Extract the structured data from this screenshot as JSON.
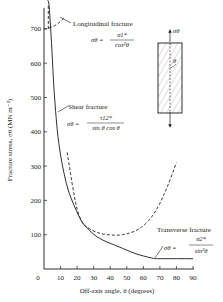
{
  "chart_data": {
    "type": "line",
    "title": "",
    "xlabel": "Off-axis angle, θ (degrees)",
    "ylabel": "Fracture stress, σθ (MN m⁻²)",
    "xlim": [
      0,
      90
    ],
    "ylim": [
      0,
      750
    ],
    "x_ticks": [
      0,
      10,
      20,
      30,
      40,
      50,
      60,
      70,
      80,
      90
    ],
    "y_ticks": [
      100,
      200,
      300,
      400,
      500,
      600,
      700
    ],
    "grid": false,
    "legend": null,
    "series": [
      {
        "name": "Longitudinal fracture",
        "style": "dashed",
        "formula": "σθ = σ1* / cos²θ",
        "x": [
          0,
          2,
          4,
          6,
          8,
          10,
          12
        ],
        "y": [
          700,
          701,
          704,
          708,
          714,
          722,
          732
        ]
      },
      {
        "name": "Shear fracture",
        "style": "solid",
        "formula": "σθ = τ12* / (sin θ cos θ)",
        "x": [
          2,
          3,
          4,
          5,
          6,
          8,
          10,
          12,
          15,
          20,
          23,
          25,
          30,
          35,
          40,
          45,
          50,
          55,
          60,
          65,
          67
        ],
        "y": [
          900,
          780,
          700,
          620,
          520,
          400,
          330,
          280,
          220,
          165,
          135,
          125,
          100,
          85,
          75,
          65,
          55,
          45,
          38,
          32,
          30
        ]
      },
      {
        "name": "Transverse fracture",
        "style": "dashed",
        "formula": "σθ = σ2* / sin²θ",
        "x": [
          14,
          16,
          18,
          20,
          23,
          25,
          30,
          35,
          40,
          45,
          50,
          55,
          60,
          65,
          70,
          75,
          80
        ],
        "y": [
          340,
          280,
          220,
          170,
          135,
          125,
          110,
          102,
          99,
          98,
          102,
          110,
          125,
          150,
          190,
          245,
          310
        ]
      },
      {
        "name": "Transverse fracture (lower bound)",
        "style": "solid",
        "x": [
          67,
          70,
          80,
          90
        ],
        "y": [
          30,
          30,
          30,
          30
        ]
      }
    ],
    "annotations": [
      {
        "text": "Longitudinal fracture",
        "formula_lhs": "σθ =",
        "formula_num": "σ1*",
        "formula_den": "cos²θ"
      },
      {
        "text": "Shear fracture",
        "formula_lhs": "σθ =",
        "formula_num": "τ12*",
        "formula_den": "sin θ cos θ"
      },
      {
        "text": "Transverse fracture",
        "formula_lhs": "σθ =",
        "formula_num": "σ2*",
        "formula_den": "sin²θ"
      }
    ],
    "inset": {
      "description": "Specimen with fibres at angle θ under uniaxial stress",
      "stress_label": "σθ",
      "angle_label": "θ"
    }
  },
  "labels": {
    "x_axis_title": "Off-axis angle, θ (degrees)",
    "y_axis_title": "Fracture stress, σθ (MN m⁻²)",
    "x_ticks": [
      "0",
      "10",
      "20",
      "30",
      "40",
      "50",
      "60",
      "70",
      "80",
      "90"
    ],
    "y_ticks": [
      "100",
      "200",
      "300",
      "400",
      "500",
      "600",
      "700"
    ],
    "longitudinal": {
      "name": "Longitudinal fracture",
      "lhs": "σθ =",
      "num": "σ1*",
      "den": "cos²θ"
    },
    "shear": {
      "name": "Shear fracture",
      "lhs": "σθ =",
      "num": "τ12*",
      "den": "sin θ cos θ"
    },
    "transverse": {
      "name": "Transverse fracture",
      "lhs": "σθ =",
      "num": "σ2*",
      "den": "sin²θ"
    },
    "inset_stress": "σθ",
    "inset_angle": "θ"
  },
  "colors": {
    "ink": "#1a1a1a",
    "background": "#ffffff"
  }
}
